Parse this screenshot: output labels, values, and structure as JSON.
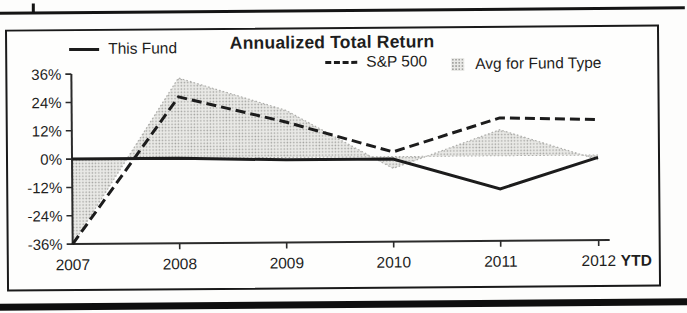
{
  "chart_data": {
    "type": "line",
    "title": "Annualized Total Return",
    "categories": [
      "2007",
      "2008",
      "2009",
      "2010",
      "2011",
      "2012"
    ],
    "x_suffix_label": "YTD",
    "ylim": [
      -36,
      36
    ],
    "ytick_values": [
      36,
      24,
      12,
      0,
      -12,
      -24,
      -36
    ],
    "yticks": [
      "36%",
      "24%",
      "12%",
      "0%",
      "-12%",
      "-24%",
      "-36%"
    ],
    "grid": false,
    "legend_position": "top",
    "series": [
      {
        "name": "This Fund",
        "style": "solid-line",
        "values": [
          0,
          0,
          -1,
          -1,
          -14,
          -1
        ]
      },
      {
        "name": "S&P 500",
        "style": "dashed-line",
        "values": [
          -36,
          26,
          15,
          2,
          16,
          15
        ]
      },
      {
        "name": "Avg for Fund Type",
        "style": "shaded-area-to-zero-baseline",
        "values": [
          -36,
          34,
          20,
          -5,
          11,
          -2
        ]
      }
    ],
    "colors": {
      "ink": "#1c1c1c",
      "axis": "#2b2b2b",
      "area_fill": "#e9e9e6",
      "area_dot": "#a3a3a0",
      "area_edge": "#aeaeab"
    }
  }
}
